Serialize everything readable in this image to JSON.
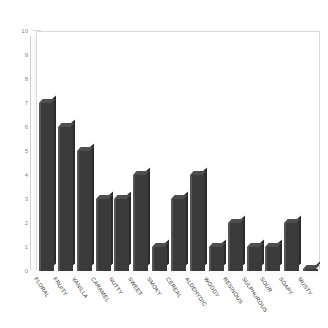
{
  "chart_data": {
    "type": "bar",
    "title": "",
    "subtitle": "",
    "xlabel": "",
    "ylabel": "",
    "ylim": [
      0,
      10
    ],
    "yticks": [
      0,
      1,
      2,
      3,
      4,
      5,
      6,
      7,
      8,
      9,
      10
    ],
    "ytick_labels": [
      "0",
      "1",
      "2",
      "3",
      "4",
      "5",
      "6",
      "7",
      "8",
      "9",
      "10"
    ],
    "grid": false,
    "legend": null,
    "legend_position": "none",
    "bar_color": "#3a3a3a",
    "bar_top_color": "#4e4e4e",
    "bar_side_color": "#2a2a2a",
    "frame_color": "#d9d9d9",
    "tick_label_color": "#8a8a8a",
    "category_label_color": "#2b2b2b",
    "category_label_rotation": 56,
    "categories": [
      "FLORAL",
      "FRUITY",
      "VANILLA",
      "CARAMEL",
      "NUTTY",
      "SWEET",
      "SMOKY",
      "CEREAL",
      "ALDEHYDIC",
      "WOODY",
      "RESINOUS",
      "SULPHUROUS",
      "SOUR",
      "SOAPY",
      "MUSTY"
    ],
    "values": [
      7,
      6,
      5,
      3,
      3,
      4,
      1,
      3,
      4,
      1,
      2,
      1,
      1,
      2,
      0
    ]
  }
}
